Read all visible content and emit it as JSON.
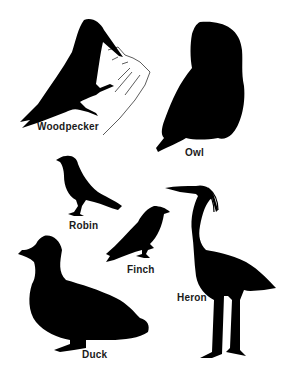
{
  "illustration": {
    "background": "#ffffff",
    "silhouette_color": "#000000",
    "birds": [
      {
        "id": "woodpecker",
        "label": "Woodpecker"
      },
      {
        "id": "owl",
        "label": "Owl"
      },
      {
        "id": "robin",
        "label": "Robin"
      },
      {
        "id": "finch",
        "label": "Finch"
      },
      {
        "id": "duck",
        "label": "Duck"
      },
      {
        "id": "heron",
        "label": "Heron"
      }
    ]
  }
}
